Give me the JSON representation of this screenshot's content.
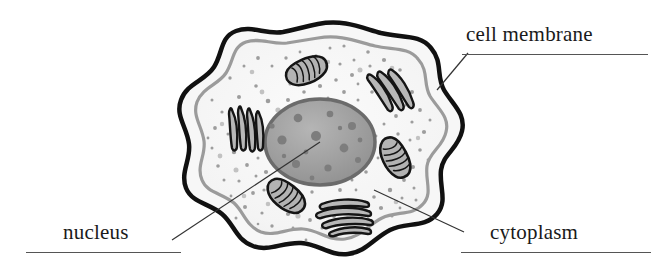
{
  "figure": {
    "background_color": "#ffffff"
  },
  "labels": {
    "cell_membrane": "cell membrane",
    "nucleus": "nucleus",
    "cytoplasm": "cytoplasm"
  },
  "colors": {
    "outline": "#111111",
    "membrane_outer": "#111111",
    "membrane_gap": "#f7f7f7",
    "membrane_inner_line": "#9b9b9b",
    "cytoplasm_fill": "#f4f4f4",
    "nucleus_fill": "#9d9d9d",
    "nucleus_edge": "#6f6f6f",
    "nucleus_spot": "#7d7d7d",
    "organelle_fill": "#b0b0b0",
    "granule": "#9a9a9a",
    "leader_line": "#333333",
    "text": "#1a1a1a",
    "rule": "#555555"
  },
  "parts": [
    {
      "name": "cell-membrane",
      "label": "cell membrane",
      "count": 1
    },
    {
      "name": "cytoplasm",
      "label": "cytoplasm",
      "count": 1
    },
    {
      "name": "nucleus",
      "label": "nucleus",
      "count": 1
    },
    {
      "name": "mitochondrion",
      "label": "mitochondrion",
      "count": 3
    },
    {
      "name": "endoplasmic-reticulum",
      "label": "endoplasmic reticulum",
      "count": 2
    },
    {
      "name": "golgi-apparatus",
      "label": "golgi apparatus",
      "count": 1
    }
  ],
  "leader_lines": [
    {
      "name": "cell-membrane",
      "from": [
        437,
        90
      ],
      "to": [
        468,
        53
      ]
    },
    {
      "name": "nucleus",
      "from": [
        320,
        142
      ],
      "to": [
        172,
        240
      ]
    },
    {
      "name": "cytoplasm",
      "from": [
        374,
        190
      ],
      "to": [
        464,
        232
      ]
    }
  ]
}
